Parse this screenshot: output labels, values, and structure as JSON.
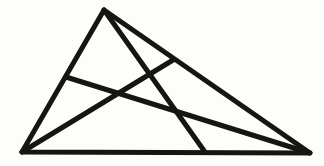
{
  "figure": {
    "kind": "line-drawing",
    "canvas": {
      "width": 324,
      "height": 166,
      "background": "#fdfdfc"
    },
    "ink_color": "#161514",
    "stroke_width": 5.0,
    "points": {
      "apex": {
        "label": "A",
        "x": 104,
        "y": 10
      },
      "bottom_left": {
        "label": "B",
        "x": 22,
        "y": 152
      },
      "bottom_right": {
        "label": "C",
        "x": 310,
        "y": 153
      },
      "base_foot": {
        "label": "D",
        "x": 205,
        "y": 152
      },
      "left_side_point": {
        "label": "E",
        "x": 66,
        "y": 77
      },
      "right_side_point": {
        "label": "F",
        "x": 173,
        "y": 60
      }
    },
    "outline": {
      "name": "main-triangle",
      "path": "M 104 10 L 22 152 L 310 153 Z"
    },
    "cevians": [
      {
        "name": "cevian-apex-to-base",
        "from": "apex",
        "to": "base_foot",
        "path": "M 104 10 L 205 152"
      },
      {
        "name": "cevian-leftside-to-right",
        "from": "left_side_point",
        "to": "bottom_right",
        "path": "M 66 77 L 310 153"
      },
      {
        "name": "cevian-bottomleft-to-rightside",
        "from": "bottom_left",
        "to": "right_side_point",
        "path": "M 22 152 L 173 60"
      }
    ],
    "intersections": [
      {
        "name": "crossing-left",
        "x": 113,
        "y": 97
      },
      {
        "name": "crossing-upper",
        "x": 148,
        "y": 79
      },
      {
        "name": "crossing-lower",
        "x": 180,
        "y": 117
      }
    ]
  }
}
